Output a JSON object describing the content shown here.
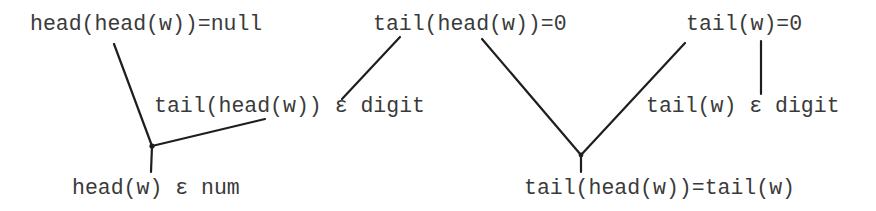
{
  "diagram": {
    "type": "proof-tree",
    "nodes": [
      {
        "id": "n1",
        "label": "head(head(w))=null"
      },
      {
        "id": "n2",
        "label": "tail(head(w))=0"
      },
      {
        "id": "n3",
        "label": "tail(w)=0"
      },
      {
        "id": "n4",
        "label": "tail(head(w)) ε digit"
      },
      {
        "id": "n5",
        "label": "tail(w) ε digit"
      },
      {
        "id": "n6",
        "label": "head(w) ε num"
      },
      {
        "id": "n7",
        "label": "tail(head(w))=tail(w)"
      }
    ],
    "edges": [
      {
        "from": "n1",
        "to": "n6"
      },
      {
        "from": "n4",
        "to": "n6"
      },
      {
        "from": "n2",
        "to": "n4"
      },
      {
        "from": "n2",
        "to": "n7"
      },
      {
        "from": "n5",
        "to": "n7"
      },
      {
        "from": "n3",
        "to": "n5"
      }
    ]
  }
}
